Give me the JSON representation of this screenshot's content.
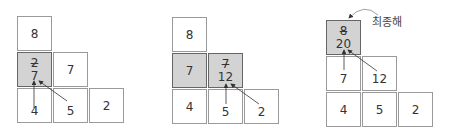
{
  "panels": [
    {
      "cells": [
        {
          "label": "8"
        },
        {
          "old": "2",
          "new": "7"
        },
        {
          "label": "7"
        },
        {
          "label": "4"
        },
        {
          "label": "5"
        },
        {
          "label": "2"
        }
      ]
    },
    {
      "cells": [
        {
          "label": "8"
        },
        {
          "label": "7"
        },
        {
          "old": "7",
          "new": "12"
        },
        {
          "label": "4"
        },
        {
          "label": "5"
        },
        {
          "label": "2"
        }
      ]
    },
    {
      "cells": [
        {
          "old": "8",
          "new": "20"
        },
        {
          "label": "7"
        },
        {
          "label": "12"
        },
        {
          "label": "4"
        },
        {
          "label": "5"
        },
        {
          "label": "2"
        }
      ],
      "annotation": "최종해"
    }
  ],
  "colors": {
    "highlight": "#d3d3d3",
    "border": "#9a9a9a",
    "arrow": "#333333"
  }
}
